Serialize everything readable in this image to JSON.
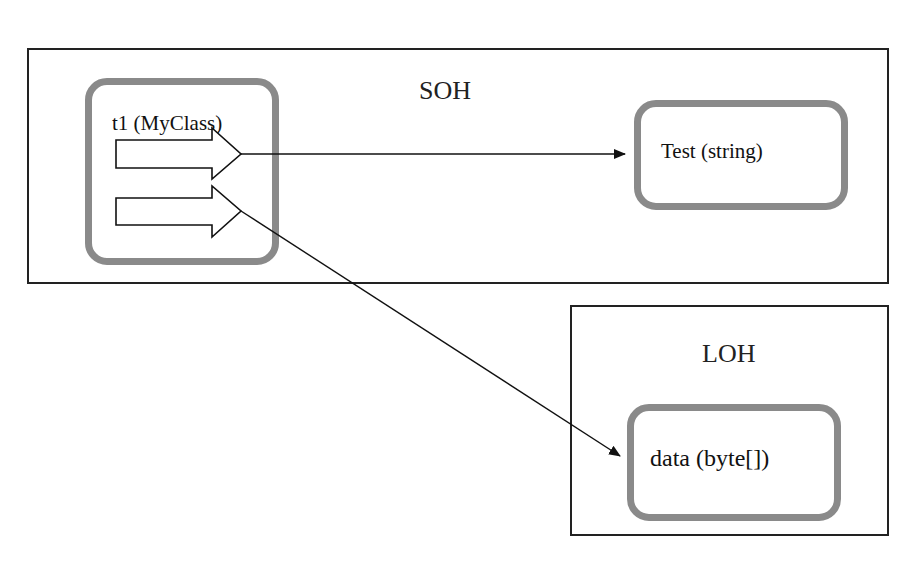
{
  "diagram": {
    "heaps": [
      {
        "id": "soh",
        "label": "SOH"
      },
      {
        "id": "loh",
        "label": "LOH"
      }
    ],
    "objects": [
      {
        "id": "t1",
        "label": "t1 (MyClass)",
        "heap": "SOH",
        "fields": 2
      },
      {
        "id": "test",
        "label": "Test (string)",
        "heap": "SOH"
      },
      {
        "id": "data",
        "label": "data (byte[])",
        "heap": "LOH"
      }
    ],
    "references": [
      {
        "from": "t1.field1",
        "to": "Test (string)"
      },
      {
        "from": "t1.field2",
        "to": "data (byte[])"
      }
    ],
    "colors": {
      "object_border": "#8a8a8a",
      "heap_border": "#222222",
      "arrow": "#111111"
    }
  }
}
